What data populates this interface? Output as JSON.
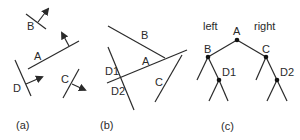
{
  "panel_a": {
    "caption": "(a)",
    "labels": {
      "A": "A",
      "B": "B",
      "C": "C",
      "D": "D"
    }
  },
  "panel_b": {
    "caption": "(b)",
    "labels": {
      "A": "A",
      "B": "B",
      "C": "C",
      "D1": "D1",
      "D2": "D2"
    }
  },
  "panel_c": {
    "caption": "(c)",
    "left_label": "left",
    "right_label": "right",
    "nodes": {
      "A": "A",
      "B": "B",
      "C": "C",
      "D1": "D1",
      "D2": "D2"
    }
  },
  "colors": {
    "stroke": "#2a2a2a",
    "background": "#ffffff"
  }
}
